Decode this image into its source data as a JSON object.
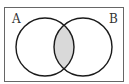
{
  "diagram": {
    "type": "venn",
    "sets": [
      {
        "label": "A"
      },
      {
        "label": "B"
      }
    ],
    "shaded_region": "A ∩ B",
    "colors": {
      "border": "#555555",
      "circle_stroke": "#1a1a1a",
      "shade": "#d9d9d9",
      "background": "#ffffff"
    }
  }
}
